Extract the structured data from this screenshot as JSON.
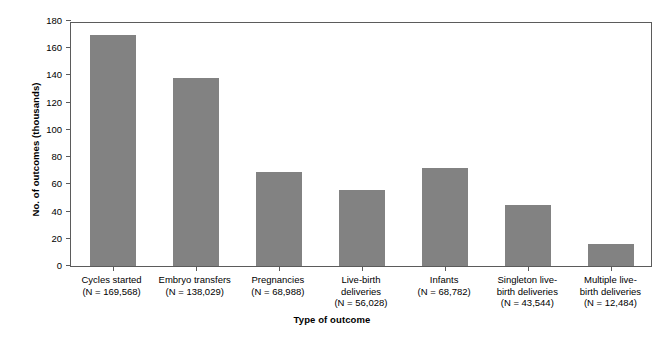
{
  "chart_data": {
    "type": "bar",
    "title": "",
    "xlabel": "Type of outcome",
    "ylabel": "No. of outcomes (thousands)",
    "ylim": [
      0,
      180
    ],
    "yticks": [
      0,
      20,
      40,
      60,
      80,
      100,
      120,
      140,
      160,
      180
    ],
    "ytick_labels": [
      "0",
      "20",
      "40",
      "60",
      "80",
      "100",
      "120",
      "140",
      "160",
      "180"
    ],
    "grid": false,
    "legend": null,
    "bar_color": "#828282",
    "axis_color": "#5b5b5b",
    "categories": [
      "Cycles started\n(N = 169,568)",
      "Embryo transfers\n(N = 138,029)",
      "Pregnancies\n(N = 68,988)",
      "Live-birth\ndeliveries\n(N = 56,028)",
      "Infants\n(N = 68,782)",
      "Singleton live-\nbirth deliveries\n(N = 43,544)",
      "Multiple live-\nbirth deliveries\n(N = 12,484)"
    ],
    "category_names": [
      "Cycles started",
      "Embryo transfers",
      "Pregnancies",
      "Live-birth deliveries",
      "Infants",
      "Singleton live-birth deliveries",
      "Multiple live-birth deliveries"
    ],
    "counts": [
      169568,
      138029,
      68988,
      56028,
      68782,
      43544,
      12484
    ],
    "values": [
      170,
      138,
      69,
      56,
      72,
      45,
      16
    ]
  }
}
